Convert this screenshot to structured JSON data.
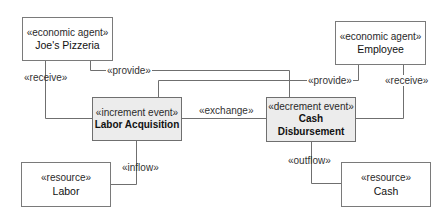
{
  "diagram": {
    "nodes": {
      "joes_pizzeria": {
        "stereotype": "«economic agent»",
        "name": "Joe's Pizzeria"
      },
      "employee": {
        "stereotype": "«economic agent»",
        "name": "Employee"
      },
      "labor_acquisition": {
        "stereotype": "«increment event»",
        "name": "Labor Acquisition"
      },
      "cash_disbursement": {
        "stereotype": "«decrement event»",
        "name_line1": "Cash",
        "name_line2": "Disbursement"
      },
      "labor": {
        "stereotype": "«resource»",
        "name": "Labor"
      },
      "cash": {
        "stereotype": "«resource»",
        "name": "Cash"
      }
    },
    "edges": {
      "receive_left": "«receive»",
      "provide_top": "«provide»",
      "provide_right": "«provide»",
      "receive_right": "«receive»",
      "exchange": "«exchange»",
      "inflow": "«inflow»",
      "outflow": "«outflow»"
    },
    "colors": {
      "line": "#6f6f6f",
      "event_fill": "#ececec",
      "box_fill": "#ffffff"
    }
  }
}
